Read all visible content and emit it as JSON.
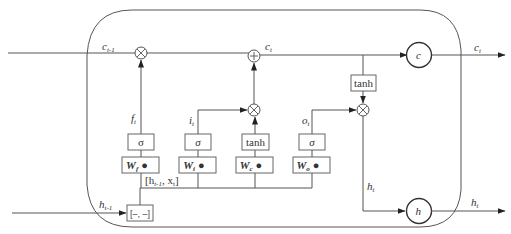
{
  "diagram": {
    "type": "LSTM cell",
    "labels": {
      "c_prev": "c",
      "c_prev_sub": "t-1",
      "c_t": "c",
      "c_t_sub": "t",
      "c_out": "c",
      "c_out_sub": "t",
      "h_prev": "h",
      "h_prev_sub": "t-1",
      "h_t_inner": "h",
      "h_t_inner_sub": "t",
      "h_out": "h",
      "h_out_sub": "t",
      "f_t": "f",
      "f_t_sub": "t",
      "i_t": "i",
      "i_t_sub": "t",
      "o_t": "o",
      "o_t_sub": "t",
      "concat": "[h",
      "concat_sub": "t-1",
      "concat_rest": ",  x",
      "concat_rest_sub": "t",
      "concat_close": "]"
    },
    "gates": [
      {
        "name": "forget",
        "activation": "σ",
        "weight": "W",
        "weight_sub": "f",
        "dot": "●"
      },
      {
        "name": "input",
        "activation": "σ",
        "weight": "W",
        "weight_sub": "i",
        "dot": "●"
      },
      {
        "name": "candidate",
        "activation": "tanh",
        "weight": "W",
        "weight_sub": "c",
        "dot": "●"
      },
      {
        "name": "output",
        "activation": "σ",
        "weight": "W",
        "weight_sub": "o",
        "dot": "●"
      }
    ],
    "operators": {
      "multiply": "⊗",
      "add": "+",
      "output_tanh": "tanh",
      "concat_box": "[–, –]"
    },
    "state_nodes": {
      "cell": "c",
      "hidden": "h"
    }
  }
}
